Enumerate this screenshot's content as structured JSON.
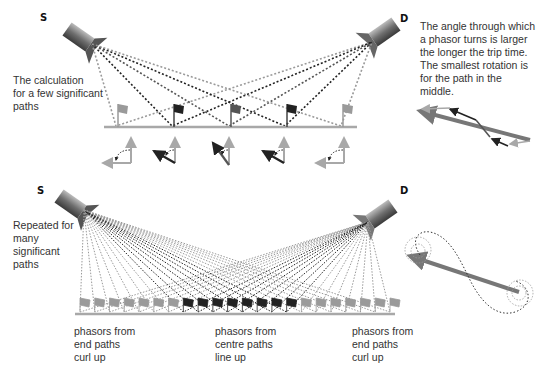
{
  "top_panel": {
    "source_label": "S",
    "detector_label": "D",
    "caption": "The calculation\nfor a few significant\npaths",
    "side_note": "The angle through which\na phasor turns is larger\nthe longer the trip time.\nThe smallest rotation is\nfor the path in the\nmiddle.",
    "path_count": 5
  },
  "bottom_panel": {
    "source_label": "S",
    "detector_label": "D",
    "caption": "Repeated for\nmany\nsignificant\npaths",
    "labels": {
      "left": "phasors from\nend paths\ncurl up",
      "centre": "phasors from\ncentre paths\nline up",
      "right": "phasors from\nend paths\ncurl up"
    },
    "path_count": 22
  },
  "colors": {
    "light_path": "#9a9a9a",
    "dark_path": "#222222",
    "mirror": "#a8a8a8",
    "resultant": "#777777"
  }
}
